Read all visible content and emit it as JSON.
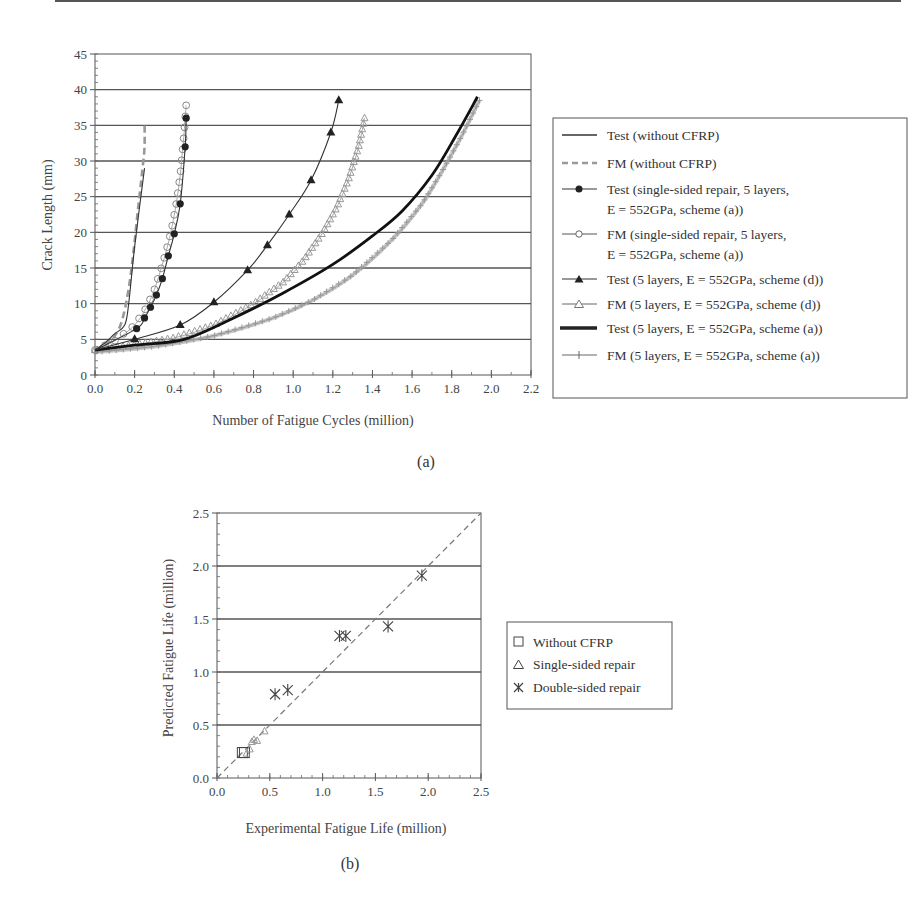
{
  "chart_data": [
    {
      "id": "a",
      "type": "line",
      "caption": "(a)",
      "title": "",
      "xlabel": "Number of Fatigue Cycles (million)",
      "ylabel": "Crack Length (mm)",
      "xlim": [
        0.0,
        2.2
      ],
      "ylim": [
        0,
        45
      ],
      "xticks": [
        "0.0",
        "0.2",
        "0.4",
        "0.6",
        "0.8",
        "1.0",
        "1.2",
        "1.4",
        "1.6",
        "1.8",
        "2.0",
        "2.2"
      ],
      "yticks": [
        "0",
        "5",
        "10",
        "15",
        "20",
        "25",
        "30",
        "35",
        "40",
        "45"
      ],
      "grid": "horizontal",
      "legend_position": "right",
      "series": [
        {
          "name": "Test (without CFRP)",
          "style": "solid-thin",
          "color": "#333333",
          "marker": "none",
          "x": [
            0.0,
            0.05,
            0.1,
            0.15,
            0.17,
            0.2,
            0.25
          ],
          "y": [
            3.5,
            4.5,
            5.8,
            7.0,
            10.0,
            18.0,
            29.0
          ]
        },
        {
          "name": "FM (without CFRP)",
          "style": "dashed",
          "color": "#999999",
          "marker": "none",
          "x": [
            0.0,
            0.05,
            0.1,
            0.14,
            0.18,
            0.22,
            0.24,
            0.25,
            0.25
          ],
          "y": [
            3.5,
            4.3,
            5.5,
            8.0,
            14.0,
            24.0,
            29.0,
            32.0,
            35.5
          ]
        },
        {
          "name": "Test (single-sided repair, 5 layers, E = 552GPa, scheme (a))",
          "style": "solid-thin",
          "color": "#222222",
          "marker": "filled-circle",
          "x": [
            0.0,
            0.21,
            0.25,
            0.28,
            0.31,
            0.34,
            0.37,
            0.4,
            0.43,
            0.455,
            0.46
          ],
          "y": [
            3.5,
            6.5,
            8.0,
            9.5,
            11.2,
            13.5,
            16.7,
            19.8,
            24.0,
            32.0,
            36.0
          ]
        },
        {
          "name": "FM (single-sided repair, 5 layers, E = 552GPa, scheme (a))",
          "style": "solid-thin",
          "color": "#888888",
          "marker": "open-circle",
          "x": [
            0.0,
            0.1,
            0.2,
            0.26,
            0.3,
            0.34,
            0.37,
            0.39,
            0.41,
            0.43,
            0.44,
            0.45,
            0.455,
            0.46
          ],
          "y": [
            3.5,
            4.8,
            7.0,
            9.5,
            12.0,
            15.5,
            18.5,
            21.0,
            24.0,
            28.0,
            31.0,
            34.0,
            36.0,
            37.8
          ]
        },
        {
          "name": "Test (5 layers, E = 552GPa, scheme (d))",
          "style": "solid-thin",
          "color": "#222222",
          "marker": "filled-triangle",
          "x": [
            0.0,
            0.2,
            0.43,
            0.6,
            0.77,
            0.87,
            0.98,
            1.09,
            1.19,
            1.23
          ],
          "y": [
            3.5,
            5.0,
            7.0,
            10.2,
            14.7,
            18.2,
            22.5,
            27.3,
            34.0,
            38.5
          ]
        },
        {
          "name": "FM (5 layers, E = 552GPa, scheme (d))",
          "style": "solid-thin",
          "color": "#999999",
          "marker": "open-triangle",
          "x": [
            0.0,
            0.2,
            0.4,
            0.6,
            0.8,
            0.95,
            1.05,
            1.15,
            1.22,
            1.28,
            1.33,
            1.36
          ],
          "y": [
            3.5,
            4.2,
            5.2,
            7.0,
            10.0,
            13.0,
            16.0,
            20.0,
            23.5,
            27.5,
            32.0,
            36.0
          ]
        },
        {
          "name": "Test (5 layers, E = 552GPa, scheme (a))",
          "style": "solid-thick",
          "color": "#111111",
          "marker": "none",
          "x": [
            0.0,
            0.2,
            0.45,
            0.7,
            0.95,
            1.2,
            1.4,
            1.55,
            1.7,
            1.82,
            1.93
          ],
          "y": [
            3.5,
            4.2,
            5.0,
            8.0,
            11.5,
            15.5,
            19.5,
            23.0,
            28.0,
            33.5,
            39.0
          ]
        },
        {
          "name": "FM (5 layers, E = 552GPa, scheme (a))",
          "style": "solid-thin",
          "color": "#999999",
          "marker": "plus",
          "x": [
            0.0,
            0.3,
            0.6,
            0.9,
            1.1,
            1.3,
            1.5,
            1.65,
            1.75,
            1.85,
            1.94
          ],
          "y": [
            3.2,
            4.0,
            5.5,
            8.0,
            10.5,
            14.0,
            19.0,
            24.0,
            28.5,
            33.5,
            38.5
          ]
        }
      ]
    },
    {
      "id": "b",
      "type": "scatter",
      "caption": "(b)",
      "title": "",
      "xlabel": "Experimental Fatigue Life (million)",
      "ylabel": "Predicted Fatigue Life (million)",
      "xlim": [
        0.0,
        2.5
      ],
      "ylim": [
        0.0,
        2.5
      ],
      "xticks": [
        "0.0",
        "0.5",
        "1.0",
        "1.5",
        "2.0",
        "2.5"
      ],
      "yticks": [
        "0.0",
        "0.5",
        "1.0",
        "1.5",
        "2.0",
        "2.5"
      ],
      "grid": "horizontal",
      "reference_line": {
        "style": "dashed",
        "from": [
          0,
          0
        ],
        "to": [
          2.5,
          2.5
        ],
        "label": "y = x"
      },
      "legend_position": "right",
      "series": [
        {
          "name": "Without CFRP",
          "marker": "open-square",
          "x": [
            0.24,
            0.26
          ],
          "y": [
            0.24,
            0.24
          ]
        },
        {
          "name": "Single-sided repair",
          "marker": "open-triangle",
          "x": [
            0.28,
            0.31,
            0.33,
            0.35,
            0.38,
            0.45
          ],
          "y": [
            0.23,
            0.27,
            0.34,
            0.36,
            0.35,
            0.44
          ]
        },
        {
          "name": "Double-sided repair",
          "marker": "asterisk",
          "x": [
            0.55,
            0.67,
            1.16,
            1.22,
            1.62,
            1.94
          ],
          "y": [
            0.79,
            0.83,
            1.34,
            1.34,
            1.43,
            1.91
          ]
        }
      ]
    }
  ],
  "figure": {
    "caption_a": "(a)",
    "caption_b": "(b)",
    "axis_titles": {
      "a_x": "Number of Fatigue Cycles (million)",
      "a_y": "Crack Length (mm)",
      "b_x": "Experimental Fatigue Life (million)",
      "b_y": "Predicted Fatigue Life (million)"
    },
    "legend_a": {
      "l1": "Test (without CFRP)",
      "l2": "FM (without CFRP)",
      "l3a": "Test (single-sided repair, 5 layers,",
      "l3b": "E = 552GPa, scheme (a))",
      "l4a": "FM (single-sided repair, 5 layers,",
      "l4b": "E = 552GPa, scheme (a))",
      "l5": "Test (5 layers, E = 552GPa, scheme (d))",
      "l6": "FM (5 layers, E = 552GPa, scheme (d))",
      "l7": "Test (5 layers, E = 552GPa, scheme (a))",
      "l8": "FM (5 layers, E = 552GPa, scheme (a))"
    },
    "legend_b": {
      "l1": "Without CFRP",
      "l2": "Single-sided repair",
      "l3": "Double-sided repair"
    },
    "colors": {
      "axis": "#444444",
      "grid": "#555555",
      "test_line": "#222222",
      "fm_line": "#999999"
    }
  }
}
